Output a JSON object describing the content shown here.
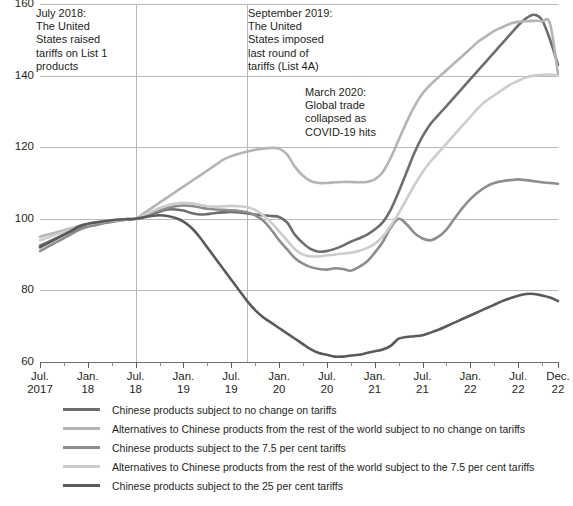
{
  "chart_data": {
    "type": "line",
    "title": "",
    "xlabel": "",
    "ylabel": "",
    "ylim": [
      60,
      160
    ],
    "yticks": [
      60,
      80,
      100,
      120,
      140,
      160
    ],
    "grid": true,
    "legend_position": "below",
    "x_tick_labels": [
      {
        "line1": "Jul.",
        "line2": "2017"
      },
      {
        "line1": "Jan.",
        "line2": "18"
      },
      {
        "line1": "Jul.",
        "line2": "18"
      },
      {
        "line1": "Jan.",
        "line2": "19"
      },
      {
        "line1": "Jul.",
        "line2": "19"
      },
      {
        "line1": "Jan.",
        "line2": "20"
      },
      {
        "line1": "Jul.",
        "line2": "20"
      },
      {
        "line1": "Jan.",
        "line2": "21"
      },
      {
        "line1": "Jul.",
        "line2": "21"
      },
      {
        "line1": "Jan.",
        "line2": "22"
      },
      {
        "line1": "Jul.",
        "line2": "22"
      },
      {
        "line1": "Dec.",
        "line2": "22"
      }
    ],
    "x": [
      "2017-07",
      "2017-08",
      "2017-09",
      "2017-10",
      "2017-11",
      "2017-12",
      "2018-01",
      "2018-02",
      "2018-03",
      "2018-04",
      "2018-05",
      "2018-06",
      "2018-07",
      "2018-08",
      "2018-09",
      "2018-10",
      "2018-11",
      "2018-12",
      "2019-01",
      "2019-02",
      "2019-03",
      "2019-04",
      "2019-05",
      "2019-06",
      "2019-07",
      "2019-08",
      "2019-09",
      "2019-10",
      "2019-11",
      "2019-12",
      "2020-01",
      "2020-02",
      "2020-03",
      "2020-04",
      "2020-05",
      "2020-06",
      "2020-07",
      "2020-08",
      "2020-09",
      "2020-10",
      "2020-11",
      "2020-12",
      "2021-01",
      "2021-02",
      "2021-03",
      "2021-04",
      "2021-05",
      "2021-06",
      "2021-07",
      "2021-08",
      "2021-09",
      "2021-10",
      "2021-11",
      "2021-12",
      "2022-01",
      "2022-02",
      "2022-03",
      "2022-04",
      "2022-05",
      "2022-06",
      "2022-07",
      "2022-08",
      "2022-09",
      "2022-10",
      "2022-11",
      "2022-12"
    ],
    "series": [
      {
        "name": "Chinese products subject to no change on tariffs",
        "color": "#6d6d6d",
        "width": 2.6,
        "values": [
          92.5,
          93.5,
          94.5,
          95.5,
          96.5,
          97.5,
          98.0,
          98.3,
          98.8,
          99.2,
          99.6,
          99.8,
          100.0,
          100.6,
          101.3,
          102.0,
          102.6,
          102.6,
          102.3,
          101.6,
          101.2,
          101.3,
          101.6,
          101.8,
          101.9,
          101.8,
          101.5,
          101.2,
          101.0,
          100.8,
          100.5,
          99.0,
          95.5,
          93.2,
          91.5,
          90.8,
          91.0,
          91.6,
          92.5,
          93.6,
          94.5,
          95.5,
          97.0,
          99.0,
          102.5,
          107.5,
          113.0,
          118.5,
          123.0,
          126.5,
          129.0,
          131.5,
          134.0,
          136.5,
          139.0,
          141.5,
          144.0,
          146.5,
          149.0,
          151.5,
          154.0,
          156.0,
          157.0,
          155.5,
          150.0,
          143.0
        ]
      },
      {
        "name": "Alternatives to Chinese products from the rest of the world subject to no change on tariffs",
        "color": "#b4b4b4",
        "width": 2.6,
        "values": [
          95.0,
          95.6,
          96.2,
          96.8,
          97.4,
          98.0,
          98.4,
          98.8,
          99.1,
          99.4,
          99.7,
          99.9,
          100.0,
          101.5,
          103.0,
          104.5,
          106.0,
          107.5,
          109.0,
          110.5,
          112.0,
          113.5,
          115.0,
          116.5,
          117.5,
          118.2,
          118.8,
          119.3,
          119.6,
          119.8,
          119.6,
          118.0,
          114.5,
          112.0,
          110.5,
          110.0,
          110.0,
          110.2,
          110.3,
          110.3,
          110.2,
          110.3,
          111.0,
          113.0,
          117.0,
          122.0,
          127.0,
          131.5,
          135.0,
          137.5,
          139.5,
          141.5,
          143.5,
          145.5,
          147.5,
          149.5,
          151.0,
          152.5,
          153.5,
          154.5,
          155.0,
          155.2,
          155.3,
          155.2,
          154.5,
          140.5
        ]
      },
      {
        "name": "Chinese products subject to the 7.5 per cent tariffs",
        "color": "#8d8d8d",
        "width": 2.6,
        "values": [
          91.0,
          92.2,
          93.4,
          94.6,
          95.8,
          97.0,
          97.8,
          98.3,
          98.8,
          99.2,
          99.5,
          99.8,
          100.0,
          100.8,
          101.6,
          102.4,
          103.0,
          103.5,
          103.7,
          103.6,
          103.2,
          102.8,
          102.6,
          102.5,
          102.4,
          102.2,
          101.8,
          101.0,
          99.5,
          97.0,
          94.0,
          91.5,
          89.0,
          87.5,
          86.5,
          86.0,
          85.8,
          86.2,
          86.0,
          85.5,
          86.5,
          88.0,
          90.5,
          93.5,
          97.5,
          100.0,
          98.5,
          96.0,
          94.5,
          94.0,
          95.0,
          97.0,
          100.0,
          103.0,
          105.5,
          107.5,
          109.0,
          110.0,
          110.5,
          110.8,
          111.0,
          110.8,
          110.5,
          110.2,
          110.0,
          109.8
        ]
      },
      {
        "name": "Alternatives to Chinese products from the rest of the world subject to the 7.5 per cent tariffs",
        "color": "#cccccc",
        "width": 2.6,
        "values": [
          94.0,
          94.8,
          95.6,
          96.4,
          97.2,
          98.0,
          98.5,
          98.9,
          99.2,
          99.5,
          99.7,
          99.9,
          100.0,
          101.0,
          102.0,
          103.0,
          103.8,
          104.3,
          104.5,
          104.3,
          103.9,
          103.5,
          103.4,
          103.5,
          103.6,
          103.5,
          103.2,
          102.5,
          101.0,
          99.0,
          96.5,
          94.0,
          91.5,
          90.0,
          89.5,
          89.5,
          89.8,
          90.0,
          90.3,
          90.5,
          91.0,
          91.8,
          93.0,
          95.0,
          98.0,
          101.5,
          105.5,
          109.5,
          113.0,
          116.0,
          118.5,
          121.0,
          123.5,
          126.0,
          128.5,
          131.0,
          133.0,
          134.5,
          136.0,
          137.5,
          138.5,
          139.5,
          140.0,
          140.2,
          140.3,
          140.0
        ]
      },
      {
        "name": "Chinese products subject to the 25 per cent tariffs",
        "color": "#5a5a5a",
        "width": 2.6,
        "values": [
          92.0,
          93.2,
          94.4,
          95.6,
          96.8,
          98.0,
          98.6,
          99.0,
          99.3,
          99.6,
          99.8,
          99.9,
          100.0,
          100.4,
          100.8,
          101.0,
          100.8,
          100.2,
          99.2,
          97.5,
          95.0,
          92.0,
          89.0,
          86.0,
          83.0,
          80.0,
          77.0,
          74.5,
          72.5,
          71.0,
          69.5,
          68.0,
          66.5,
          65.0,
          63.5,
          62.5,
          62.0,
          61.5,
          61.5,
          61.8,
          62.0,
          62.5,
          63.0,
          63.5,
          64.5,
          66.5,
          67.0,
          67.2,
          67.5,
          68.2,
          69.0,
          70.0,
          71.0,
          72.0,
          73.0,
          74.0,
          75.0,
          76.0,
          77.0,
          77.8,
          78.5,
          79.0,
          79.0,
          78.6,
          78.0,
          77.0
        ]
      }
    ],
    "annotations": [
      {
        "id": "annot-1",
        "text": "July 2018:\nThe United\nStates raised\ntariffs on List 1\nproducts",
        "x_at": "2018-07"
      },
      {
        "id": "annot-2",
        "text": "September 2019:\nThe United\nStates imposed\nlast round of\ntariffs (List 4A)",
        "x_at": "2019-09"
      },
      {
        "id": "annot-3",
        "text": "March 2020:\nGlobal trade\ncollapsed as\nCOVID-19 hits",
        "x_at": "2020-03"
      }
    ],
    "event_lines": [
      "2018-07",
      "2019-09"
    ]
  },
  "legend": {
    "items": [
      {
        "label": "Chinese products subject to no change on tariffs",
        "color": "#6d6d6d"
      },
      {
        "label": "Alternatives to Chinese products from the rest of the world subject to no change on tariffs",
        "color": "#b4b4b4"
      },
      {
        "label": "Chinese products subject to the 7.5 per cent tariffs",
        "color": "#8d8d8d"
      },
      {
        "label": "Alternatives to Chinese products from the rest of the world subject to the 7.5 per cent tariffs",
        "color": "#cccccc"
      },
      {
        "label": "Chinese products subject to the 25 per cent tariffs",
        "color": "#5a5a5a"
      }
    ]
  },
  "annotation_text": {
    "july_2018": "July 2018: The United States raised tariffs on List 1 products",
    "september_2019": "September 2019: The United States imposed last round of tariffs (List 4A)",
    "march_2020": "March 2020: Global trade collapsed as COVID-19 hits"
  }
}
